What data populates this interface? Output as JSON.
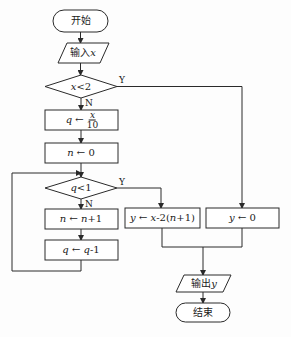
{
  "flowchart": {
    "start": {
      "label": "开始"
    },
    "input": {
      "prefix": "输入",
      "var": "x"
    },
    "cond1": {
      "var": "x",
      "op": "<",
      "value": "2",
      "yes": "Y",
      "no": "N"
    },
    "assign_q": {
      "lhs": "q",
      "arrow": "←",
      "num": "x",
      "den": "10"
    },
    "assign_n0": {
      "lhs": "n",
      "arrow": "←",
      "rhs": "0"
    },
    "cond2": {
      "var": "q",
      "op": "<",
      "value": "1",
      "yes": "Y",
      "no": "N"
    },
    "inc_n": {
      "lhs": "n",
      "arrow": "←",
      "rhs_var": "n",
      "rhs_rest": "+1"
    },
    "dec_q": {
      "lhs": "q",
      "arrow": "←",
      "rhs_var": "q",
      "rhs_rest": "-1"
    },
    "assign_y_formula": {
      "lhs": "y",
      "arrow": "←",
      "rhs_a": "x",
      "rhs_b": "-2(",
      "rhs_c": "n",
      "rhs_d": "+1)"
    },
    "assign_y0": {
      "lhs": "y",
      "arrow": "←",
      "rhs": "0"
    },
    "output": {
      "prefix": "输出",
      "var": "y"
    },
    "end": {
      "label": "结束"
    }
  }
}
